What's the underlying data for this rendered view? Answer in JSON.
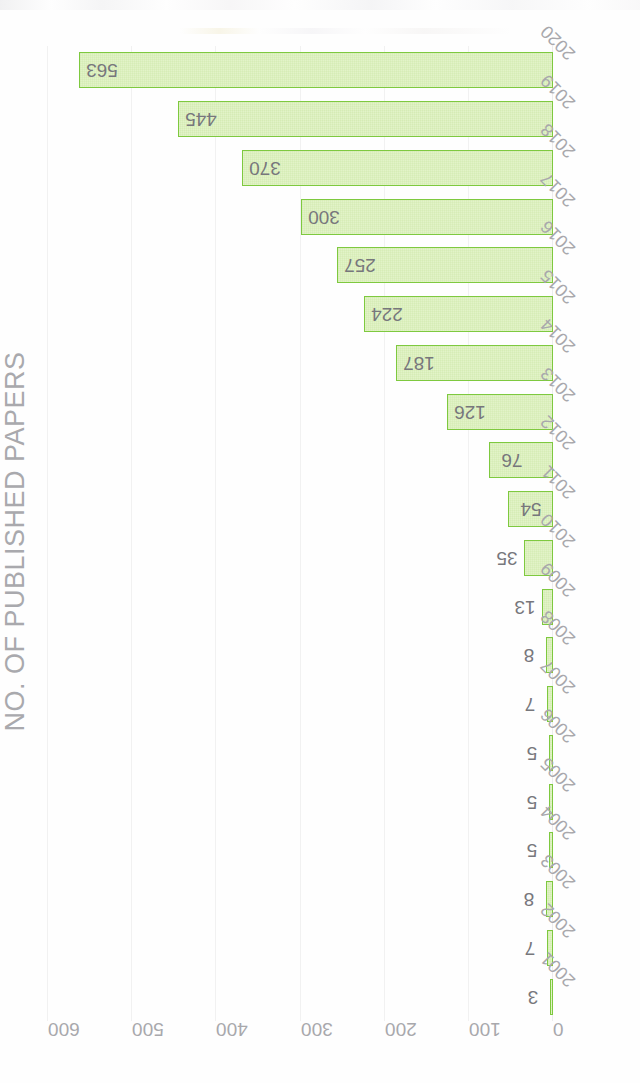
{
  "chart_data": {
    "type": "bar",
    "title": "NO. OF PUBLISHED PAPERS",
    "xlabel": "",
    "ylabel": "NO. OF PUBLISHED PAPERS",
    "orientation": "vertical",
    "rotation_deg": -90,
    "grid": true,
    "legend": "none",
    "ylim": [
      0,
      600
    ],
    "yticks": [
      0,
      100,
      200,
      300,
      400,
      500,
      600
    ],
    "ytick_labels": [
      "0",
      "100",
      "200",
      "300",
      "400",
      "500",
      "600"
    ],
    "categories": [
      "2001",
      "2002",
      "2003",
      "2004",
      "2005",
      "2006",
      "2007",
      "2008",
      "2009",
      "2010",
      "2011",
      "2012",
      "2013",
      "2014",
      "2015",
      "2016",
      "2017",
      "2018",
      "2019",
      "2020"
    ],
    "values": [
      3,
      7,
      8,
      5,
      5,
      5,
      7,
      8,
      13,
      35,
      54,
      76,
      126,
      187,
      224,
      257,
      300,
      370,
      445,
      563
    ],
    "data_labels": [
      "3",
      "7",
      "8",
      "5",
      "5",
      "5",
      "7",
      "8",
      "13",
      "35",
      "54",
      "76",
      "126",
      "187",
      "224",
      "257",
      "300",
      "370",
      "445",
      "563"
    ],
    "bar_fill_color": "#e2f3c8",
    "bar_border_color": "#7ec93f",
    "label_color": "#77777c",
    "tick_color": "#a8a8ac",
    "title_color": "#a9a9ad",
    "grid_color": "#f1f1f1",
    "background_color": "#ffffff"
  }
}
